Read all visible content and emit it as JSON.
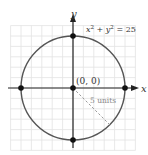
{
  "diagram": {
    "equation": "x² + y² = 25",
    "equation_parts": {
      "x": "x",
      "sup1": "2",
      "plus": " + ",
      "y": "y",
      "sup2": "2",
      "rhs": " = 25"
    },
    "center_label": "(0, 0)",
    "radius_label": "5 units",
    "x_axis_label": "x",
    "y_axis_label": "y",
    "radius": 5,
    "center": [
      0,
      0
    ],
    "points": [
      [
        0,
        5
      ],
      [
        5,
        0
      ],
      [
        0,
        -5
      ],
      [
        -5,
        0
      ],
      [
        0,
        0
      ]
    ],
    "grid_range": [
      -6,
      6
    ],
    "colors": {
      "circle": "#555555",
      "axis": "#222222",
      "grid": "#e2e2e2",
      "point": "#111111",
      "radius_line": "#9a9a9a",
      "text": "#333333"
    }
  }
}
